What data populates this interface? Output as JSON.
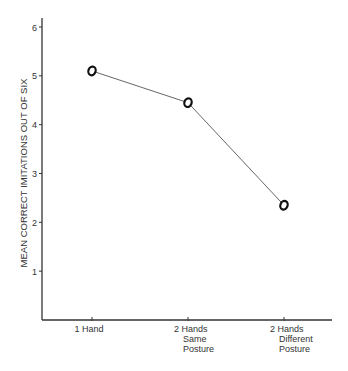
{
  "chart_data": {
    "type": "line",
    "title": "",
    "xlabel": "",
    "ylabel": "MEAN CORRECT IMITATIONS OUT OF SIX",
    "categories": [
      "1 Hand",
      "2 Hands Same Posture",
      "2 Hands Different Posture"
    ],
    "category_lines": [
      [
        "1 Hand"
      ],
      [
        "2 Hands",
        "Same",
        "Posture"
      ],
      [
        "2 Hands",
        "Different",
        "Posture"
      ]
    ],
    "series": [
      {
        "name": "Mean correct imitations",
        "values": [
          5.1,
          4.45,
          2.35
        ],
        "marker": "o"
      }
    ],
    "ylim": [
      0,
      6
    ],
    "yticks": [
      1,
      2,
      3,
      4,
      5,
      6
    ],
    "grid": false,
    "legend": "none"
  }
}
